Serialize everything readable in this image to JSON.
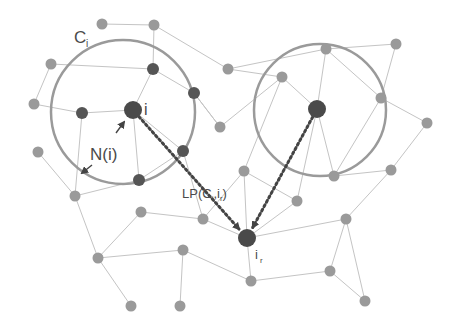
{
  "diagram": {
    "type": "network-graph",
    "labels": {
      "cluster": "C",
      "cluster_sub": "i",
      "node_i": "i",
      "neighborhood": "N(i)",
      "path_prefix": "LP(C",
      "path_sub1": "i",
      "path_mid": ",i",
      "path_sub2": "r",
      "path_suffix": ")",
      "target": "i",
      "target_sub": "r"
    },
    "colors": {
      "node_light": "#9a9a9a",
      "node_dark": "#555555",
      "node_big": "#4a4a4a",
      "edge": "#c4c4c4",
      "circle": "#9a9a9a",
      "path": "#444444"
    },
    "circles": [
      {
        "name": "cluster-C-i",
        "cx": 123,
        "cy": 112,
        "r": 72
      },
      {
        "name": "cluster-right",
        "cx": 320,
        "cy": 110,
        "r": 66
      }
    ],
    "nodes": [
      {
        "id": "n1",
        "x": 102,
        "y": 24,
        "kind": "light"
      },
      {
        "id": "n2",
        "x": 154,
        "y": 25,
        "kind": "light"
      },
      {
        "id": "n3",
        "x": 51,
        "y": 64,
        "kind": "light"
      },
      {
        "id": "n4",
        "x": 153,
        "y": 69,
        "kind": "dark"
      },
      {
        "id": "n5",
        "x": 228,
        "y": 69,
        "kind": "light"
      },
      {
        "id": "n6",
        "x": 194,
        "y": 93,
        "kind": "dark"
      },
      {
        "id": "n7",
        "x": 34,
        "y": 104,
        "kind": "light"
      },
      {
        "id": "n8",
        "x": 82,
        "y": 113,
        "kind": "dark"
      },
      {
        "id": "i",
        "x": 133,
        "y": 110,
        "kind": "big"
      },
      {
        "id": "n10",
        "x": 220,
        "y": 127,
        "kind": "light"
      },
      {
        "id": "n11",
        "x": 38,
        "y": 152,
        "kind": "light"
      },
      {
        "id": "n12",
        "x": 183,
        "y": 151,
        "kind": "dark"
      },
      {
        "id": "n13",
        "x": 139,
        "y": 180,
        "kind": "dark"
      },
      {
        "id": "n14",
        "x": 75,
        "y": 196,
        "kind": "light"
      },
      {
        "id": "n15",
        "x": 141,
        "y": 212,
        "kind": "light"
      },
      {
        "id": "n16",
        "x": 203,
        "y": 219,
        "kind": "light"
      },
      {
        "id": "n17",
        "x": 98,
        "y": 258,
        "kind": "light"
      },
      {
        "id": "n18",
        "x": 183,
        "y": 250,
        "kind": "light"
      },
      {
        "id": "n19",
        "x": 131,
        "y": 306,
        "kind": "light"
      },
      {
        "id": "n20",
        "x": 180,
        "y": 306,
        "kind": "light"
      },
      {
        "id": "n21",
        "x": 282,
        "y": 77,
        "kind": "light"
      },
      {
        "id": "n22",
        "x": 326,
        "y": 49,
        "kind": "light"
      },
      {
        "id": "n23",
        "x": 396,
        "y": 44,
        "kind": "light"
      },
      {
        "id": "n24",
        "x": 381,
        "y": 98,
        "kind": "light"
      },
      {
        "id": "c2",
        "x": 317,
        "y": 109,
        "kind": "big"
      },
      {
        "id": "n26",
        "x": 427,
        "y": 123,
        "kind": "light"
      },
      {
        "id": "n27",
        "x": 244,
        "y": 171,
        "kind": "light"
      },
      {
        "id": "n28",
        "x": 334,
        "y": 176,
        "kind": "light"
      },
      {
        "id": "n29",
        "x": 391,
        "y": 170,
        "kind": "light"
      },
      {
        "id": "n30",
        "x": 297,
        "y": 201,
        "kind": "light"
      },
      {
        "id": "n31",
        "x": 346,
        "y": 219,
        "kind": "light"
      },
      {
        "id": "ir",
        "x": 247,
        "y": 238,
        "kind": "big"
      },
      {
        "id": "n33",
        "x": 251,
        "y": 281,
        "kind": "light"
      },
      {
        "id": "n34",
        "x": 330,
        "y": 271,
        "kind": "light"
      },
      {
        "id": "n35",
        "x": 365,
        "y": 301,
        "kind": "light"
      }
    ],
    "edges": [
      [
        "n1",
        "n2"
      ],
      [
        "n2",
        "n4"
      ],
      [
        "n2",
        "n5"
      ],
      [
        "n3",
        "n4"
      ],
      [
        "n3",
        "n7"
      ],
      [
        "n7",
        "n8"
      ],
      [
        "n8",
        "i"
      ],
      [
        "n4",
        "i"
      ],
      [
        "n4",
        "n6"
      ],
      [
        "n6",
        "n10"
      ],
      [
        "i",
        "n12"
      ],
      [
        "i",
        "n13"
      ],
      [
        "n8",
        "n14"
      ],
      [
        "n11",
        "n14"
      ],
      [
        "n14",
        "n13"
      ],
      [
        "n14",
        "n17"
      ],
      [
        "n12",
        "n13"
      ],
      [
        "n12",
        "n16"
      ],
      [
        "n15",
        "n16"
      ],
      [
        "n15",
        "n17"
      ],
      [
        "n17",
        "n18"
      ],
      [
        "n17",
        "n19"
      ],
      [
        "n18",
        "n20"
      ],
      [
        "n18",
        "n33"
      ],
      [
        "n16",
        "ir"
      ],
      [
        "n5",
        "n22"
      ],
      [
        "n5",
        "n21"
      ],
      [
        "n21",
        "c2"
      ],
      [
        "n21",
        "n27"
      ],
      [
        "n21",
        "n10"
      ],
      [
        "n10",
        "n6"
      ],
      [
        "n22",
        "n23"
      ],
      [
        "n22",
        "c2"
      ],
      [
        "n22",
        "n24"
      ],
      [
        "n23",
        "n24"
      ],
      [
        "n24",
        "n26"
      ],
      [
        "n24",
        "n28"
      ],
      [
        "n26",
        "n29"
      ],
      [
        "n28",
        "n29"
      ],
      [
        "c2",
        "n28"
      ],
      [
        "c2",
        "n30"
      ],
      [
        "n27",
        "ir"
      ],
      [
        "n27",
        "n30"
      ],
      [
        "n30",
        "ir"
      ],
      [
        "ir",
        "n31"
      ],
      [
        "n31",
        "n29"
      ],
      [
        "n31",
        "n34"
      ],
      [
        "n31",
        "n35"
      ],
      [
        "n34",
        "n35"
      ],
      [
        "n34",
        "n33"
      ],
      [
        "ir",
        "n33"
      ],
      [
        "n27",
        "n16"
      ]
    ],
    "paths": [
      {
        "name": "path-i-to-ir",
        "from": "i",
        "to": "ir"
      },
      {
        "name": "path-c2-to-ir",
        "from": "c2",
        "to": "ir"
      }
    ]
  }
}
